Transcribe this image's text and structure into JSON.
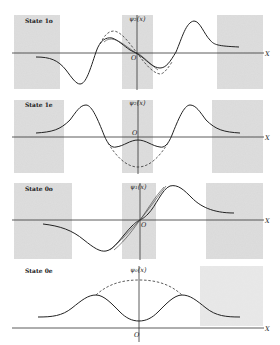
{
  "figure": {
    "axis_label_x": "X",
    "origin_label": "O",
    "shade_color": "#d6d6d6",
    "panels": [
      {
        "state_label": "State 1o",
        "psi_label": "ψ₂(x)"
      },
      {
        "state_label": "State 1e",
        "psi_label": "ψ₂(x)"
      },
      {
        "state_label": "State 0o",
        "psi_label": "ψ₁(x)"
      },
      {
        "state_label": "State 0e",
        "psi_label": "ψ₀(x)"
      }
    ]
  }
}
